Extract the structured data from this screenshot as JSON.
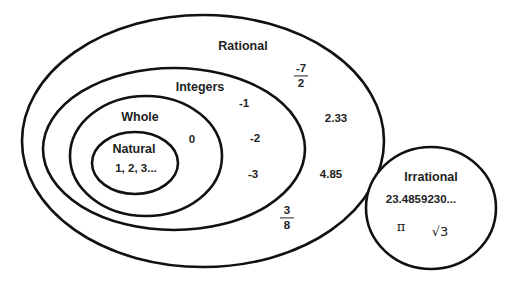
{
  "diagram": {
    "type": "venn",
    "sets": {
      "rational": {
        "label": "Rational",
        "values": [
          "-7/2",
          "2.33",
          "4.85",
          "3/8"
        ]
      },
      "integers": {
        "label": "Integers",
        "values": [
          "-1",
          "-2",
          "-3"
        ]
      },
      "whole": {
        "label": "Whole",
        "values": [
          "0"
        ]
      },
      "natural": {
        "label": "Natural",
        "values": [
          "1, 2, 3..."
        ]
      },
      "irrational": {
        "label": "Irrational",
        "values": [
          "23.4859230...",
          "π",
          "√3"
        ]
      }
    },
    "fractions": {
      "neg_seven_half": {
        "num": "-7",
        "den": "2"
      },
      "three_eighths": {
        "num": "3",
        "den": "8"
      }
    },
    "stroke_color": "#111111"
  }
}
